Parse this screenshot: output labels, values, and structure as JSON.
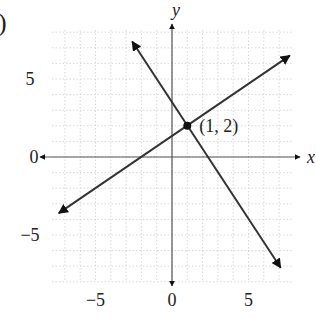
{
  "panel_label": ")",
  "chart_data": {
    "type": "line",
    "title": "",
    "xlabel": "x",
    "ylabel": "y",
    "xlim": [
      -7.8,
      7.8
    ],
    "ylim": [
      -8,
      8
    ],
    "grid": true,
    "x_ticks": [
      {
        "value": -5,
        "label": "−5"
      },
      {
        "value": 0,
        "label": "0"
      },
      {
        "value": 5,
        "label": "5"
      }
    ],
    "y_ticks": [
      {
        "value": 5,
        "label": "5"
      },
      {
        "value": 0,
        "label": "0"
      },
      {
        "value": -5,
        "label": "−5"
      }
    ],
    "series": [
      {
        "name": "line-increasing",
        "slope": 0.6667,
        "intercept": 1.3333,
        "x": [
          -7.4,
          7.7
        ],
        "y": [
          -3.6,
          6.5
        ]
      },
      {
        "name": "line-decreasing",
        "slope": -1.5,
        "intercept": 3.5,
        "x": [
          -2.6,
          7.1
        ],
        "y": [
          7.4,
          -7.1
        ]
      }
    ],
    "annotations": [
      {
        "point": [
          1,
          2
        ],
        "label": "(1, 2)"
      }
    ]
  }
}
